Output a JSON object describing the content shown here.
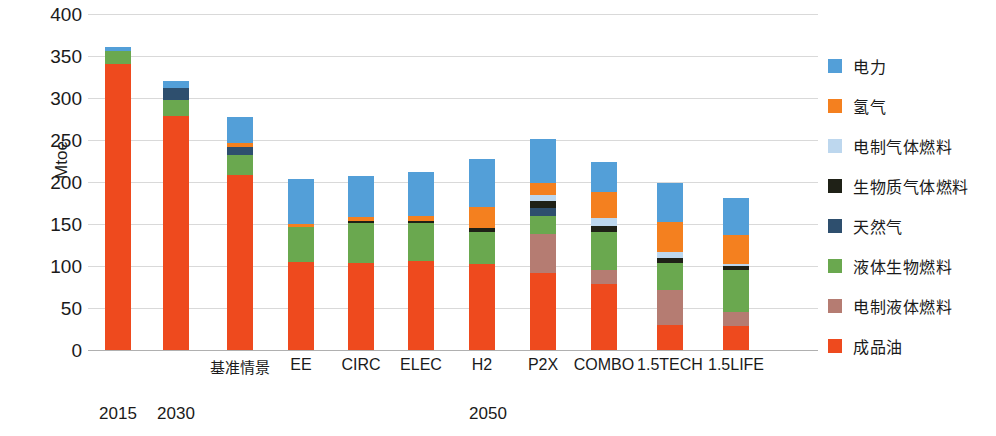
{
  "chart_data": {
    "type": "bar",
    "stacked": true,
    "title": "",
    "xlabel": "",
    "ylabel": "Mtoe",
    "ylim": [
      0,
      400
    ],
    "yticks": [
      0,
      50,
      100,
      150,
      200,
      250,
      300,
      350,
      400
    ],
    "grid": true,
    "legend_position": "right",
    "categories": [
      "2015",
      "2030",
      "基准情景",
      "EE",
      "CIRC",
      "ELEC",
      "H2",
      "P2X",
      "COMBO",
      "1.5TECH",
      "1.5LIFE"
    ],
    "groups": [
      {
        "label": "2015",
        "members": [
          "2015"
        ]
      },
      {
        "label": "2030",
        "members": [
          "2030"
        ]
      },
      {
        "label": "2050",
        "members": [
          "基准情景",
          "EE",
          "CIRC",
          "ELEC",
          "H2",
          "P2X",
          "COMBO",
          "1.5TECH",
          "1.5LIFE"
        ]
      }
    ],
    "series": [
      {
        "name": "成品油",
        "color": "#ee4a1e",
        "values": [
          340,
          278,
          208,
          105,
          104,
          106,
          102,
          92,
          78,
          30,
          28
        ]
      },
      {
        "name": "电制液体燃料",
        "color": "#b57c72",
        "values": [
          0,
          0,
          0,
          0,
          0,
          0,
          0,
          46,
          17,
          42,
          17
        ]
      },
      {
        "name": "液体生物燃料",
        "color": "#6aa84f",
        "values": [
          16,
          20,
          24,
          41,
          47,
          45,
          38,
          22,
          45,
          32,
          50
        ]
      },
      {
        "name": "天然气",
        "color": "#2e4f6e",
        "values": [
          0,
          14,
          10,
          0,
          0,
          0,
          0,
          9,
          0,
          0,
          0
        ]
      },
      {
        "name": "生物质气体燃料",
        "color": "#1f2117",
        "values": [
          0,
          0,
          0,
          0,
          3,
          3,
          5,
          8,
          8,
          6,
          5
        ]
      },
      {
        "name": "电制气体燃料",
        "color": "#bdd7ee",
        "values": [
          0,
          0,
          0,
          0,
          0,
          0,
          0,
          8,
          9,
          7,
          3
        ]
      },
      {
        "name": "氢气",
        "color": "#f4801f",
        "values": [
          0,
          0,
          4,
          4,
          4,
          5,
          25,
          14,
          31,
          35,
          34
        ]
      },
      {
        "name": "电力",
        "color": "#539fd8",
        "values": [
          5,
          8,
          32,
          54,
          49,
          53,
          57,
          52,
          36,
          47,
          44
        ]
      }
    ],
    "totals": [
      361,
      320,
      278,
      204,
      207,
      212,
      227,
      251,
      224,
      199,
      181
    ]
  },
  "legend": {
    "items": [
      {
        "label": "电力",
        "color": "#539fd8"
      },
      {
        "label": "氢气",
        "color": "#f4801f"
      },
      {
        "label": "电制气体燃料",
        "color": "#bdd7ee"
      },
      {
        "label": "生物质气体燃料",
        "color": "#1f2117"
      },
      {
        "label": "天然气",
        "color": "#2e4f6e"
      },
      {
        "label": "液体生物燃料",
        "color": "#6aa84f"
      },
      {
        "label": "电制液体燃料",
        "color": "#b57c72"
      },
      {
        "label": "成品油",
        "color": "#ee4a1e"
      }
    ]
  }
}
